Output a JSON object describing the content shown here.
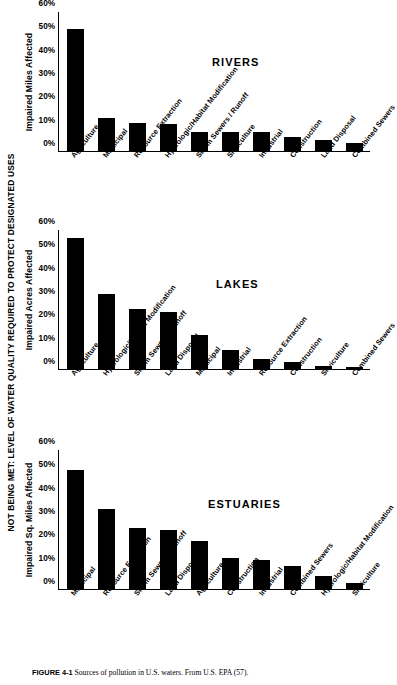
{
  "figure": {
    "side_caption": "NOT BEING MET: LEVEL OF WATER QUALITY REQUIRED TO PROTECT DESIGNATED USES",
    "caption_label": "FIGURE 4-1",
    "caption_text": "Sources of pollution in U.S. waters. From U.S. EPA (57).",
    "bar_color": "#000000",
    "background": "#ffffff"
  },
  "chart_data": [
    {
      "type": "bar",
      "title": "RIVERS",
      "ylabel": "Impaired Miles Affected",
      "xlabel": "",
      "ylim": [
        0,
        60
      ],
      "grid": false,
      "yticks": [
        "0%",
        "10%",
        "20%",
        "30%",
        "40%",
        "50%",
        "60%"
      ],
      "categories": [
        "Agriculture",
        "Municipal",
        "Resource Extraction",
        "Hydrologic/Habitat Modification",
        "Storm Sewers / Runoff",
        "Silviculture",
        "Industrial",
        "Construction",
        "Land Disposal",
        "Combined Sewers"
      ],
      "values": [
        53,
        14,
        12,
        11.5,
        8,
        8,
        8,
        6,
        4.5,
        3.5
      ]
    },
    {
      "type": "bar",
      "title": "LAKES",
      "ylabel": "Impaired Acres Affected",
      "xlabel": "",
      "ylim": [
        0,
        60
      ],
      "grid": false,
      "yticks": [
        "0%",
        "10%",
        "20%",
        "30%",
        "40%",
        "50%",
        "60%"
      ],
      "categories": [
        "Agriculture",
        "Hydrologic/Habitat Modification",
        "Storm Sewers / Runoff",
        "Land Disposal",
        "Municipal",
        "Industrial",
        "Resource Extraction",
        "Construction",
        "Silviculture",
        "Combined Sewers"
      ],
      "values": [
        57,
        32.5,
        26,
        24.5,
        14.5,
        8,
        4,
        3,
        1,
        0.5
      ]
    },
    {
      "type": "bar",
      "title": "ESTUARIES",
      "ylabel": "Impaired Sq. Miles Affected",
      "xlabel": "",
      "ylim": [
        0,
        60
      ],
      "grid": false,
      "yticks": [
        "0%",
        "10%",
        "20%",
        "30%",
        "40%",
        "50%",
        "60%"
      ],
      "categories": [
        "Municipal",
        "Resource Extraction",
        "Storm Sewers / Runoff",
        "Land Disposal",
        "Agriculture",
        "Construction",
        "Industrial",
        "Combined Sewers",
        "Hydrologic/Habitat Modification",
        "Silviculture"
      ],
      "values": [
        51.5,
        34.5,
        26.5,
        25.5,
        20.5,
        13.5,
        12.5,
        10,
        5.5,
        2.5
      ]
    }
  ]
}
